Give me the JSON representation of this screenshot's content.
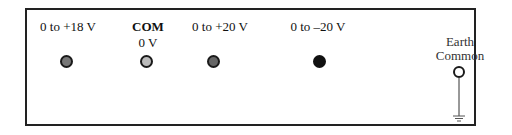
{
  "panel": {
    "terminals": [
      {
        "label": "0 to +18 V",
        "sublabel": "",
        "fill": "#777777"
      },
      {
        "label": "COM",
        "sublabel": "0 V",
        "fill": "#bbbbbb"
      },
      {
        "label": "0 to +20 V",
        "sublabel": "",
        "fill": "#666666"
      },
      {
        "label": "0 to –20 V",
        "sublabel": "",
        "fill": "#111111"
      }
    ],
    "earth": {
      "line1": "Earth",
      "line2": "Common",
      "fill": "#ffffff"
    }
  }
}
